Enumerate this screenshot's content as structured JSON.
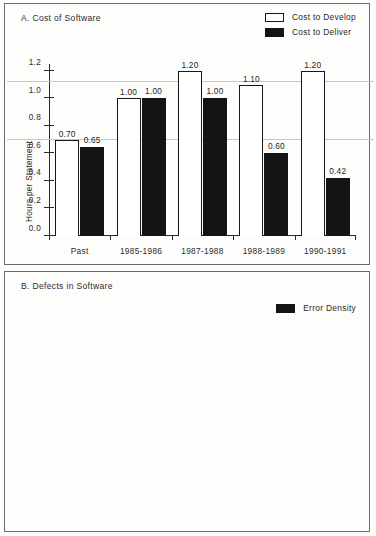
{
  "figure": {
    "background": "#fdfdfb",
    "ink": "#141414",
    "grid_color": "#c9c9c4"
  },
  "chart_data": [
    {
      "type": "bar",
      "panel_id": "A",
      "title": "A. Cost of Software",
      "xlabel": "",
      "ylabel": "Hours per Statement",
      "ylim": [
        0,
        1.25
      ],
      "yticks": [
        "0.0",
        "0.2",
        "0.4",
        "0.6",
        "0.8",
        "1.0",
        "1.2"
      ],
      "ytick_values": [
        0,
        0.2,
        0.4,
        0.6,
        0.8,
        1.0,
        1.2
      ],
      "grid": true,
      "gridline_values": [
        0.7,
        1.12
      ],
      "legend_position": "top-right",
      "categories": [
        "Past",
        "1985-1986",
        "1987-1988",
        "1988-1989",
        "1990-1991"
      ],
      "series": [
        {
          "name": "Cost to Develop",
          "style": "open",
          "color": "#ffffff",
          "edge": "#181818",
          "values": [
            0.7,
            1.0,
            1.2,
            1.1,
            1.2
          ],
          "labels": [
            "0.70",
            "1.00",
            "1.20",
            "1.10",
            "1.20"
          ]
        },
        {
          "name": "Cost to Deliver",
          "style": "filled",
          "color": "#141414",
          "edge": "#141414",
          "values": [
            0.65,
            1.0,
            1.0,
            0.6,
            0.42
          ],
          "labels": [
            "0.65",
            "1.00",
            "1.00",
            "0.60",
            "0.42"
          ]
        }
      ]
    },
    {
      "type": "bar",
      "panel_id": "B",
      "title": "B. Defects in Software",
      "xlabel": "",
      "ylabel": "Defects per 1,000 Lines of Code",
      "ylim": [
        0,
        4.15
      ],
      "yticks": [
        "0.0",
        "0.5",
        "1.0",
        "1.5",
        "2.0",
        "2.5",
        "3.0",
        "3.5",
        "4.0"
      ],
      "ytick_values": [
        0,
        0.5,
        1.0,
        1.5,
        2.0,
        2.5,
        3.0,
        3.5,
        4.0
      ],
      "grid": true,
      "gridline_values": [
        0.85,
        3.65
      ],
      "legend_position": "top-right",
      "categories": [
        "Past",
        "1985-1986",
        "1987-1988",
        "1988-1989",
        "1990-1991"
      ],
      "series": [
        {
          "name": "Error Density",
          "style": "filled",
          "color": "#141414",
          "edge": "#141414",
          "values": [
            3.9,
            1.8,
            2.1,
            0.9,
            0.5
          ],
          "labels": [
            "3.90",
            "1.80",
            "2.10",
            "0.90",
            "0.50"
          ]
        }
      ]
    }
  ]
}
